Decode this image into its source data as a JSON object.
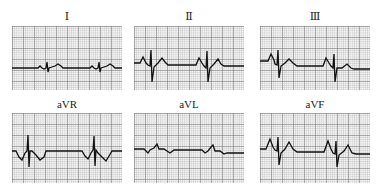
{
  "figure": {
    "title": "",
    "colors": {
      "grid_major": "#8a8a8a",
      "grid_minor": "#c8c8c8",
      "trace": "#111111",
      "paper": "#f4f4f4"
    },
    "leads": [
      {
        "id": "I",
        "label": "Ⅰ",
        "points": "0,42 26,42 28,40 30,42 32,43 34,42 35,36 36,46 37,42 40,41 43,40 46,38 49,40 51,42 78,42 80,40 82,42 84,43 86,42 87,36 88,46 89,42 92,41 95,40 98,38 101,40 103,42 110,42"
      },
      {
        "id": "II",
        "label": "Ⅱ",
        "points": "0,37 6,37 9,31 12,37 14,39 16,40 17,24 18,56 20,41 24,37 28,32 31,36 34,39 62,39 65,32 68,37 70,40 72,42 73,25 74,56 76,42 80,38 84,33 87,38 90,40 110,40"
      },
      {
        "id": "III",
        "label": "Ⅲ",
        "points": "0,35 8,35 11,28 14,34 15,38 17,39 18,24 19,52 21,40 25,37 29,33 33,37 37,40 63,40 66,32 69,37 71,40 73,42 74,28 75,56 77,42 82,42 87,38 91,42 94,43 110,43"
      },
      {
        "id": "aVR",
        "label": "aVR",
        "points": "0,38 4,38 7,44 10,47 13,40 15,38 16,22 17,54 18,38 20,38 24,42 28,47 32,44 34,38 70,38 73,43 76,46 79,40 81,37 82,23 83,53 84,37 86,40 90,44 94,48 97,43 100,38 110,38"
      },
      {
        "id": "aVL",
        "label": "aVL",
        "points": "0,36 10,36 12,38 14,40 16,37 20,35 23,31 25,36 30,36 33,38 36,40 40,37 68,37 71,40 74,38 77,34 79,32 81,38 86,38 90,41 93,40 96,40 110,40"
      },
      {
        "id": "aVF",
        "label": "aVF",
        "points": "0,36 6,36 10,26 13,34 15,37 17,38 18,24 19,52 21,40 25,36 29,29 33,36 37,39 64,39 68,28 71,36 73,40 75,41 76,28 77,54 79,42 84,38 88,32 92,40 96,41 110,41"
      }
    ]
  }
}
